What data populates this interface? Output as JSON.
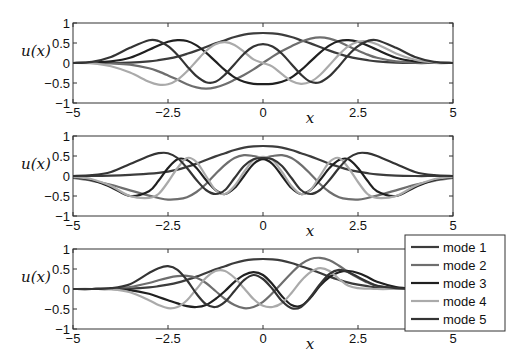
{
  "chart_data": {
    "type": "line",
    "layout": "3 stacked subplots, shared legend in bottom-right",
    "legend_position": "lower right (outside bottom subplot)",
    "legend": [
      "mode 1",
      "mode 2",
      "mode 3",
      "mode 4",
      "mode 5"
    ],
    "colors": [
      "#3c3c3c",
      "#6e6e6e",
      "#202020",
      "#aaaaaa",
      "#343434"
    ],
    "subplots": [
      {
        "xlabel": "x",
        "ylabel": "u(x)",
        "xlim": [
          -5,
          5
        ],
        "ylim": [
          -1,
          1
        ],
        "xticks": [
          "-5",
          "-2.5",
          "0",
          "2.5",
          "5"
        ],
        "yticks": [
          "1",
          "0.5",
          "0",
          "-0.5",
          "-1"
        ],
        "x": [
          -5,
          -4.5,
          -4,
          -3.5,
          -3,
          -2.75,
          -2.5,
          -2.25,
          -2,
          -1.75,
          -1.5,
          -1.25,
          -1,
          -0.75,
          -0.5,
          -0.25,
          0,
          0.25,
          0.5,
          0.75,
          1,
          1.25,
          1.5,
          1.75,
          2,
          2.25,
          2.5,
          2.75,
          3,
          3.5,
          4,
          4.5,
          5
        ],
        "series": [
          {
            "name": "mode 1",
            "values": [
              0,
              0,
              0,
              0.01,
              0.04,
              0.07,
              0.11,
              0.16,
              0.23,
              0.31,
              0.4,
              0.49,
              0.57,
              0.65,
              0.71,
              0.74,
              0.75,
              0.74,
              0.71,
              0.65,
              0.57,
              0.49,
              0.4,
              0.31,
              0.23,
              0.16,
              0.11,
              0.07,
              0.04,
              0.01,
              0,
              0,
              0
            ]
          },
          {
            "name": "mode 2",
            "values": [
              0,
              0,
              -0.01,
              -0.04,
              -0.13,
              -0.21,
              -0.31,
              -0.42,
              -0.53,
              -0.61,
              -0.64,
              -0.61,
              -0.53,
              -0.42,
              -0.3,
              -0.16,
              0,
              0.16,
              0.3,
              0.42,
              0.53,
              0.61,
              0.64,
              0.61,
              0.53,
              0.42,
              0.31,
              0.21,
              0.13,
              0.04,
              0.01,
              0,
              0
            ]
          },
          {
            "name": "mode 3",
            "values": [
              0,
              0.01,
              0.04,
              0.13,
              0.33,
              0.44,
              0.53,
              0.57,
              0.55,
              0.44,
              0.26,
              0.04,
              -0.18,
              -0.36,
              -0.47,
              -0.52,
              -0.53,
              -0.52,
              -0.47,
              -0.36,
              -0.18,
              0.04,
              0.26,
              0.44,
              0.55,
              0.57,
              0.53,
              0.44,
              0.33,
              0.13,
              0.04,
              0.01,
              0
            ]
          },
          {
            "name": "mode 4",
            "values": [
              0,
              -0.01,
              -0.08,
              -0.24,
              -0.47,
              -0.54,
              -0.53,
              -0.42,
              -0.21,
              0.05,
              0.3,
              0.47,
              0.52,
              0.45,
              0.28,
              0.09,
              0,
              -0.09,
              -0.28,
              -0.45,
              -0.52,
              -0.47,
              -0.3,
              -0.05,
              0.21,
              0.42,
              0.53,
              0.54,
              0.47,
              0.24,
              0.08,
              0.01,
              0
            ]
          },
          {
            "name": "mode 5",
            "values": [
              0,
              0.03,
              0.15,
              0.38,
              0.57,
              0.55,
              0.42,
              0.2,
              -0.08,
              -0.33,
              -0.48,
              -0.47,
              -0.29,
              -0.03,
              0.23,
              0.41,
              0.47,
              0.41,
              0.23,
              -0.03,
              -0.29,
              -0.47,
              -0.48,
              -0.33,
              -0.08,
              0.2,
              0.42,
              0.55,
              0.57,
              0.38,
              0.15,
              0.03,
              0
            ]
          }
        ]
      },
      {
        "xlabel": "x",
        "ylabel": "u(x)",
        "xlim": [
          -5,
          5
        ],
        "ylim": [
          -1,
          1
        ],
        "xticks": [
          "-5",
          "-2.5",
          "0",
          "2.5",
          "5"
        ],
        "yticks": [
          "1",
          "0.5",
          "0",
          "-0.5",
          "-1"
        ],
        "x": [
          -5,
          -4.5,
          -4,
          -3.5,
          -3,
          -2.75,
          -2.5,
          -2.25,
          -2,
          -1.75,
          -1.5,
          -1.25,
          -1,
          -0.75,
          -0.5,
          -0.25,
          0,
          0.25,
          0.5,
          0.75,
          1,
          1.25,
          1.5,
          1.75,
          2,
          2.25,
          2.5,
          2.75,
          3,
          3.5,
          4,
          4.5,
          5
        ],
        "series": [
          {
            "name": "mode 1",
            "values": [
              0,
              0,
              0.01,
              0.03,
              0.06,
              0.08,
              0.11,
              0.16,
              0.23,
              0.31,
              0.4,
              0.49,
              0.57,
              0.65,
              0.71,
              0.74,
              0.75,
              0.74,
              0.71,
              0.65,
              0.57,
              0.49,
              0.4,
              0.31,
              0.23,
              0.16,
              0.11,
              0.07,
              0.04,
              0.01,
              0,
              0,
              0
            ]
          },
          {
            "name": "mode 2",
            "values": [
              -0.05,
              -0.12,
              -0.22,
              -0.36,
              -0.49,
              -0.55,
              -0.59,
              -0.58,
              -0.53,
              -0.4,
              -0.2,
              0.05,
              0.28,
              0.45,
              0.52,
              0.5,
              0.45,
              0.5,
              0.52,
              0.45,
              0.28,
              0.05,
              -0.2,
              -0.4,
              -0.53,
              -0.58,
              -0.59,
              -0.55,
              -0.49,
              -0.36,
              -0.22,
              -0.12,
              -0.05
            ]
          },
          {
            "name": "mode 3",
            "values": [
              -0.03,
              -0.1,
              -0.28,
              -0.5,
              -0.38,
              -0.12,
              0.2,
              0.42,
              0.4,
              0.2,
              -0.1,
              -0.35,
              -0.45,
              -0.3,
              0.0,
              0.3,
              0.42,
              0.3,
              0.0,
              -0.3,
              -0.45,
              -0.35,
              -0.1,
              0.2,
              0.4,
              0.42,
              0.2,
              -0.12,
              -0.38,
              -0.5,
              -0.28,
              -0.1,
              -0.03
            ]
          },
          {
            "name": "mode 4",
            "values": [
              -0.02,
              -0.08,
              -0.25,
              -0.5,
              -0.55,
              -0.45,
              -0.15,
              0.2,
              0.45,
              0.35,
              0.0,
              -0.35,
              -0.45,
              -0.25,
              0.1,
              0.4,
              0.48,
              0.4,
              0.1,
              -0.25,
              -0.45,
              -0.35,
              0.0,
              0.35,
              0.45,
              0.2,
              -0.15,
              -0.45,
              -0.55,
              -0.5,
              -0.25,
              -0.08,
              -0.02
            ]
          },
          {
            "name": "mode 5",
            "values": [
              0,
              0.02,
              0.1,
              0.3,
              0.5,
              0.57,
              0.57,
              0.45,
              0.2,
              -0.1,
              -0.35,
              -0.45,
              -0.35,
              -0.05,
              0.25,
              0.42,
              0.45,
              0.42,
              0.25,
              -0.05,
              -0.35,
              -0.45,
              -0.35,
              -0.1,
              0.2,
              0.45,
              0.57,
              0.57,
              0.5,
              0.3,
              0.1,
              0.02,
              0
            ]
          }
        ]
      },
      {
        "xlabel": "x",
        "ylabel": "u(x)",
        "xlim": [
          -5,
          5
        ],
        "ylim": [
          -1,
          1
        ],
        "xticks": [
          "-5",
          "-2.5",
          "0",
          "2.5",
          "5"
        ],
        "yticks": [
          "1",
          "0.5",
          "0",
          "-0.5",
          "-1"
        ],
        "x": [
          -5,
          -4.5,
          -4,
          -3.5,
          -3,
          -2.75,
          -2.5,
          -2.25,
          -2,
          -1.75,
          -1.5,
          -1.25,
          -1,
          -0.75,
          -0.5,
          -0.25,
          0,
          0.25,
          0.5,
          0.75,
          1,
          1.25,
          1.5,
          1.75,
          2,
          2.25,
          2.5,
          2.75,
          3,
          3.5,
          4,
          4.5,
          5
        ],
        "series": [
          {
            "name": "mode 1",
            "values": [
              0,
              0,
              0,
              0.01,
              0.04,
              0.07,
              0.11,
              0.16,
              0.23,
              0.31,
              0.4,
              0.49,
              0.57,
              0.65,
              0.71,
              0.74,
              0.75,
              0.74,
              0.71,
              0.65,
              0.57,
              0.49,
              0.4,
              0.31,
              0.23,
              0.16,
              0.11,
              0.07,
              0.04,
              0.01,
              0,
              0,
              0
            ]
          },
          {
            "name": "mode 2",
            "values": [
              0,
              0,
              0.01,
              0.05,
              0.15,
              0.22,
              0.28,
              0.32,
              0.33,
              0.28,
              0.15,
              -0.05,
              -0.25,
              -0.4,
              -0.48,
              -0.45,
              -0.32,
              -0.1,
              0.15,
              0.4,
              0.62,
              0.75,
              0.78,
              0.72,
              0.58,
              0.42,
              0.28,
              0.16,
              0.08,
              0.02,
              0,
              0,
              0
            ]
          },
          {
            "name": "mode 3",
            "values": [
              0,
              0,
              0,
              -0.03,
              -0.12,
              -0.2,
              -0.28,
              -0.36,
              -0.43,
              -0.45,
              -0.4,
              -0.25,
              -0.05,
              0.18,
              0.35,
              0.42,
              0.35,
              0.12,
              -0.18,
              -0.4,
              -0.42,
              -0.22,
              0.08,
              0.3,
              0.42,
              0.45,
              0.4,
              0.3,
              0.18,
              0.05,
              0.01,
              0,
              0
            ]
          },
          {
            "name": "mode 4",
            "values": [
              0,
              0,
              -0.01,
              -0.08,
              -0.28,
              -0.4,
              -0.48,
              -0.45,
              -0.28,
              0.0,
              0.28,
              0.45,
              0.45,
              0.28,
              0.02,
              -0.25,
              -0.42,
              -0.45,
              -0.35,
              -0.1,
              0.2,
              0.42,
              0.52,
              0.45,
              0.25,
              0.08,
              0.02,
              0.01,
              0,
              0,
              0,
              0,
              0
            ]
          },
          {
            "name": "mode 5",
            "values": [
              0,
              0,
              0.02,
              0.12,
              0.4,
              0.52,
              0.57,
              0.48,
              0.22,
              -0.12,
              -0.38,
              -0.45,
              -0.32,
              -0.05,
              0.22,
              0.35,
              0.25,
              0.0,
              -0.3,
              -0.48,
              -0.45,
              -0.2,
              0.12,
              0.38,
              0.48,
              0.42,
              0.3,
              0.18,
              0.08,
              0.02,
              0,
              0,
              0
            ]
          }
        ]
      }
    ]
  }
}
